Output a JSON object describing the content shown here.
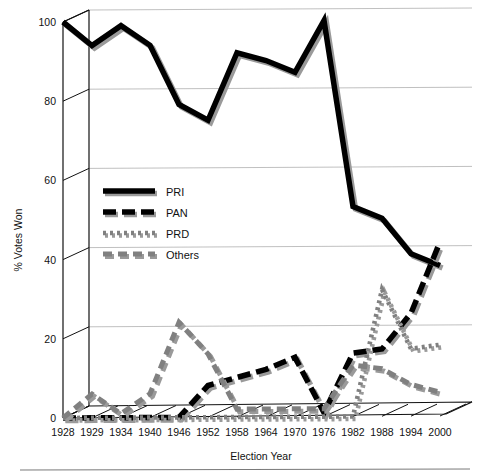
{
  "chart_data": {
    "type": "line",
    "title": "",
    "xlabel": "Election Year",
    "ylabel": "% Votes Won",
    "categories": [
      "1928",
      "1929",
      "1934",
      "1940",
      "1946",
      "1952",
      "1958",
      "1964",
      "1970",
      "1976",
      "1982",
      "1988",
      "1994",
      "2000"
    ],
    "x_tick_labels": [
      "1928",
      "1929",
      "1934",
      "1940",
      "1946",
      "1952",
      "1958",
      "1964",
      "1970",
      "1976",
      "1982",
      "1988",
      "1994",
      "2000"
    ],
    "y_tick_labels": [
      "0",
      "20",
      "40",
      "60",
      "80",
      "100"
    ],
    "y_ticks": [
      0,
      20,
      40,
      60,
      80,
      100
    ],
    "ylim": [
      0,
      100
    ],
    "grid": true,
    "grid_axis": "y",
    "legend_position": "center-left",
    "style": "3d-perspective",
    "series": [
      {
        "name": "PRI",
        "line_style": "solid",
        "color": "#000000",
        "values": [
          100,
          94,
          99,
          94,
          79,
          75,
          92,
          90,
          87,
          100,
          53,
          50,
          41,
          38
        ]
      },
      {
        "name": "PAN",
        "line_style": "long-dash",
        "color": "#000000",
        "values": [
          0,
          0,
          0,
          0,
          0,
          8,
          10,
          12,
          15,
          1,
          16,
          17,
          26,
          44
        ]
      },
      {
        "name": "PRD",
        "line_style": "dotted",
        "color": "#808080",
        "values": [
          0,
          0,
          0,
          0,
          0,
          0,
          0,
          0,
          0,
          0,
          0,
          32,
          17,
          18
        ]
      },
      {
        "name": "Others",
        "line_style": "dash",
        "color": "#808080",
        "values": [
          0,
          6,
          1,
          6,
          24,
          16,
          2,
          2,
          2,
          2,
          13,
          12,
          8,
          6
        ]
      }
    ]
  },
  "legend": {
    "items": [
      {
        "label": "PRI",
        "swatch": "solid-thick-black"
      },
      {
        "label": "PAN",
        "swatch": "long-dash-black"
      },
      {
        "label": "PRD",
        "swatch": "dotted-gray"
      },
      {
        "label": "Others",
        "swatch": "dash-gray"
      }
    ]
  },
  "axes": {
    "x_title": "Election Year",
    "y_title": "% Votes Won"
  }
}
